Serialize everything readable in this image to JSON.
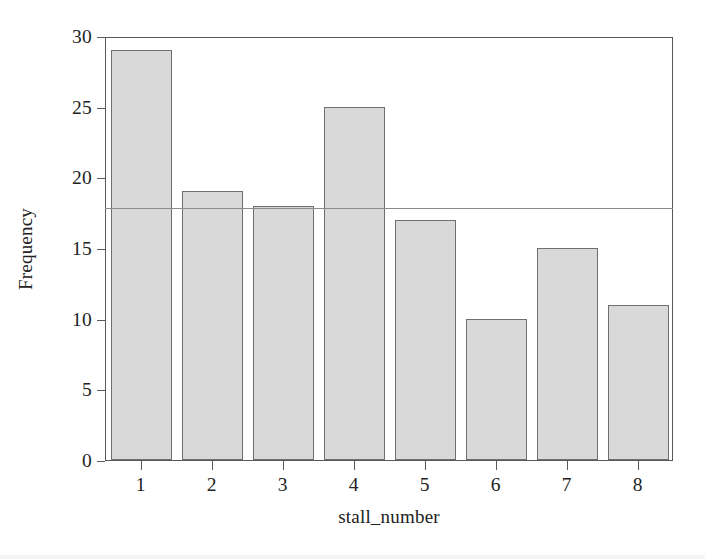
{
  "chart_data": {
    "type": "bar",
    "title": "",
    "subtitle": "",
    "xlabel": "stall_number",
    "ylabel": "Frequency",
    "categories": [
      "1",
      "2",
      "3",
      "4",
      "5",
      "6",
      "7",
      "8"
    ],
    "values": [
      29,
      19,
      18,
      25,
      17,
      10,
      15,
      11
    ],
    "series": [
      {
        "name": "Frequency",
        "values": [
          29,
          19,
          18,
          25,
          17,
          10,
          15,
          11
        ]
      }
    ],
    "ylim": [
      0,
      30
    ],
    "xlim": [
      0.5,
      8.5
    ],
    "ytick_labels": [
      "0",
      "5",
      "10",
      "15",
      "20",
      "25",
      "30"
    ],
    "ytick_values": [
      0,
      5,
      10,
      15,
      20,
      25,
      30
    ],
    "xtick_labels": [
      "1",
      "2",
      "3",
      "4",
      "5",
      "6",
      "7",
      "8"
    ],
    "grid": false,
    "legend": null,
    "legend_position": "none",
    "annotations": [
      {
        "kind": "horizontal-reference-line",
        "value": 18,
        "label": ""
      }
    ],
    "colors": {
      "bar_fill": "#d9d9d9",
      "bar_edge": "#6f6f6f",
      "axis": "#5a5a5a",
      "reference_line": "#8b8b8b",
      "text": "#222222",
      "background": "#ffffff"
    }
  }
}
